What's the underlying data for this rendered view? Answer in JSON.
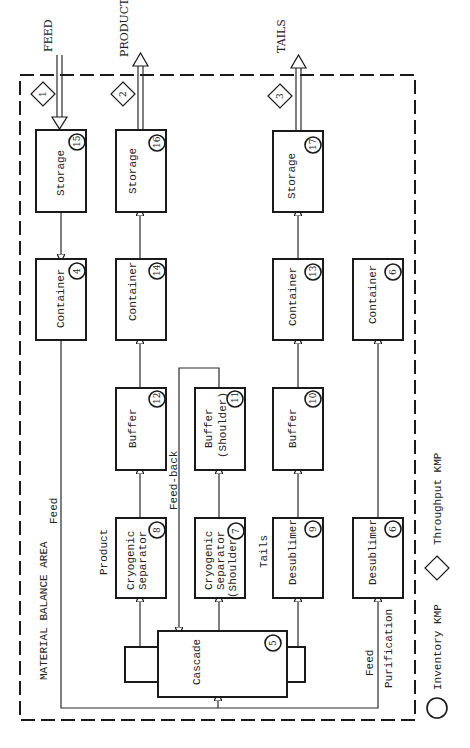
{
  "diagram": {
    "area_label": "MATERIAL BALANCE AREA",
    "external_flows": {
      "feed": {
        "label": "FEED",
        "kmp": "1"
      },
      "product": {
        "label": "PRODUCT",
        "kmp": "2"
      },
      "tails": {
        "label": "TAILS",
        "kmp": "3"
      }
    },
    "nodes": {
      "storage_feed": {
        "label": "Storage",
        "kmp": "15"
      },
      "storage_product": {
        "label": "Storage",
        "kmp": "16"
      },
      "storage_tails": {
        "label": "Storage",
        "kmp": "17"
      },
      "container_feed": {
        "label": "Container",
        "kmp": "4"
      },
      "container_product": {
        "label": "Container",
        "kmp": "14"
      },
      "container_tails": {
        "label": "Container",
        "kmp": "13"
      },
      "container_purification": {
        "label": "Container",
        "kmp": "6"
      },
      "buffer_product": {
        "label": "Buffer",
        "kmp": "12"
      },
      "buffer_shoulder": {
        "label_line1": "Buffer",
        "label_line2": "(Shoulder)",
        "kmp": "11"
      },
      "buffer_tails": {
        "label": "Buffer",
        "kmp": "10"
      },
      "cryo_product": {
        "label_line1": "Cryogenic",
        "label_line2": "Separator",
        "kmp": "8"
      },
      "cryo_shoulder": {
        "label_line1": "Cryogenic",
        "label_line2": "Separator",
        "label_line3": "(Shoulder)",
        "kmp": "7"
      },
      "desublimer_tails": {
        "label": "Desublimer",
        "kmp": "9"
      },
      "desublimer_purification": {
        "label": "Desublimer",
        "kmp": "6"
      },
      "cascade": {
        "label": "Cascade",
        "kmp": "5"
      }
    },
    "stream_labels": {
      "feed": "Feed",
      "feed_back": "Feed-back",
      "product": "Product",
      "tails": "Tails",
      "feed_purification_line1": "Feed",
      "feed_purification_line2": "Purification"
    },
    "legend": {
      "inventory": "Inventory KMP",
      "throughput": "Throughput KMP"
    }
  }
}
